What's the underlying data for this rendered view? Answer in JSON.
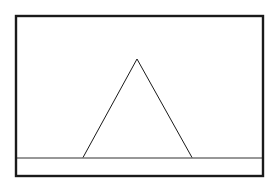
{
  "diagram": {
    "colors": {
      "background": "#ffffff",
      "stroke": "#1a1a1a"
    },
    "frame": {
      "x": 16,
      "y": 16,
      "width": 247,
      "height": 160,
      "stroke_width": 2.4
    },
    "ground_line": {
      "x1": 17,
      "y1": 158,
      "x2": 262,
      "y2": 158,
      "stroke_width": 0.9
    },
    "triangle": {
      "apex": {
        "x": 137,
        "y": 59
      },
      "base_left": {
        "x": 83,
        "y": 157.5
      },
      "base_right": {
        "x": 192,
        "y": 157.5
      },
      "stroke_width": 1
    }
  }
}
